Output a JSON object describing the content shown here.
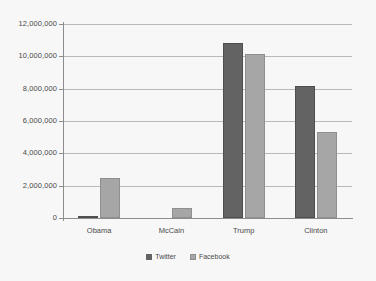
{
  "chart_data": {
    "type": "bar",
    "title": "",
    "xlabel": "",
    "ylabel": "",
    "categories": [
      "Obama",
      "McCain",
      "Trump",
      "Clinton"
    ],
    "series": [
      {
        "name": "Twitter",
        "color": "#636363",
        "values": [
          150000,
          0,
          10800000,
          8150000
        ]
      },
      {
        "name": "Facebook",
        "color": "#a6a6a6",
        "values": [
          2500000,
          600000,
          10150000,
          5300000
        ]
      }
    ],
    "ylim": [
      0,
      12000000
    ],
    "yticks": [
      0,
      2000000,
      4000000,
      6000000,
      8000000,
      10000000,
      12000000
    ],
    "ytick_labels": [
      "0",
      "2,000,000",
      "4,000,000",
      "6,000,000",
      "8,000,000",
      "10,000,000",
      "12,000,000"
    ],
    "grid": true,
    "legend_position": "bottom"
  },
  "legend": {
    "items": [
      {
        "label": "Twitter"
      },
      {
        "label": "Facebook"
      }
    ]
  },
  "colors": {
    "background": "#f7f7f7",
    "gridline": "#b9b9b9",
    "axis": "#8d8d8d",
    "text": "#4a4a4a",
    "twitter": "#636363",
    "facebook": "#a6a6a6"
  }
}
